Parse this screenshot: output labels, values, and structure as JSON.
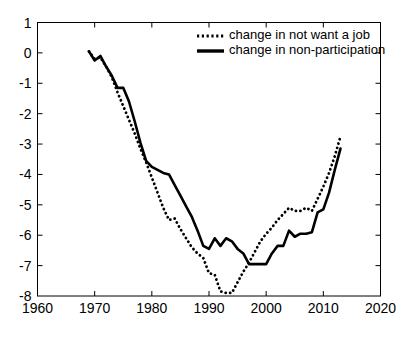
{
  "chart_data": {
    "type": "line",
    "title": "",
    "subtitle": "",
    "xlabel": "",
    "ylabel": "",
    "xlim": [
      1960,
      2020
    ],
    "ylim": [
      -8,
      1
    ],
    "xticks": [
      1960,
      1970,
      1980,
      1990,
      2000,
      2010,
      2020
    ],
    "xticklabels": [
      "1960",
      "1970",
      "1980",
      "1990",
      "2000",
      "2010",
      "2020"
    ],
    "yticks": [
      1,
      0,
      -1,
      -2,
      -3,
      -4,
      -5,
      -6,
      -7,
      -8
    ],
    "yticklabels": [
      "1",
      "0",
      "-1",
      "-2",
      "-3",
      "-4",
      "-5",
      "-6",
      "-7",
      "-8"
    ],
    "grid": false,
    "legend_position": "top-center",
    "series": [
      {
        "name": "change in not want a job",
        "style": "dotted",
        "color": "#000000",
        "x": [
          1969,
          1970,
          1971,
          1972,
          1973,
          1974,
          1975,
          1976,
          1977,
          1978,
          1979,
          1980,
          1981,
          1982,
          1983,
          1984,
          1985,
          1986,
          1987,
          1988,
          1989,
          1990,
          1991,
          1992,
          1993,
          1994,
          1995,
          1996,
          1997,
          1998,
          1999,
          2000,
          2001,
          2002,
          2003,
          2004,
          2005,
          2006,
          2007,
          2008,
          2009,
          2010,
          2011,
          2012,
          2013
        ],
        "y": [
          0.05,
          -0.2,
          -0.15,
          -0.45,
          -0.8,
          -1.3,
          -1.75,
          -2.2,
          -2.65,
          -3.15,
          -3.6,
          -4.1,
          -4.6,
          -5.1,
          -5.5,
          -5.45,
          -5.8,
          -6.1,
          -6.4,
          -6.6,
          -6.75,
          -7.25,
          -7.3,
          -7.85,
          -7.9,
          -7.9,
          -7.55,
          -7.2,
          -6.9,
          -6.55,
          -6.2,
          -5.95,
          -5.75,
          -5.5,
          -5.3,
          -5.1,
          -5.2,
          -5.2,
          -5.1,
          -5.2,
          -4.8,
          -4.4,
          -3.95,
          -3.4,
          -2.75
        ]
      },
      {
        "name": "change in non-participation",
        "style": "solid",
        "color": "#000000",
        "x": [
          1969,
          1970,
          1971,
          1972,
          1973,
          1974,
          1975,
          1976,
          1977,
          1978,
          1979,
          1980,
          1981,
          1982,
          1983,
          1984,
          1985,
          1986,
          1987,
          1988,
          1989,
          1990,
          1991,
          1992,
          1993,
          1994,
          1995,
          1996,
          1997,
          1998,
          1999,
          2000,
          2001,
          2002,
          2003,
          2004,
          2005,
          2006,
          2007,
          2008,
          2009,
          2010,
          2011,
          2012,
          2013
        ],
        "y": [
          0.05,
          -0.25,
          -0.1,
          -0.45,
          -0.75,
          -1.15,
          -1.15,
          -1.6,
          -2.25,
          -2.95,
          -3.55,
          -3.75,
          -3.85,
          -3.95,
          -4.0,
          -4.35,
          -4.7,
          -5.05,
          -5.4,
          -5.85,
          -6.35,
          -6.45,
          -6.1,
          -6.35,
          -6.1,
          -6.2,
          -6.45,
          -6.6,
          -6.95,
          -6.95,
          -6.95,
          -6.95,
          -6.6,
          -6.35,
          -6.35,
          -5.85,
          -6.05,
          -5.95,
          -5.95,
          -5.9,
          -5.25,
          -5.15,
          -4.6,
          -3.85,
          -3.15
        ]
      }
    ],
    "legend": [
      {
        "label": "change in not want a job",
        "style": "dotted"
      },
      {
        "label": "change in non-participation",
        "style": "solid"
      }
    ]
  }
}
